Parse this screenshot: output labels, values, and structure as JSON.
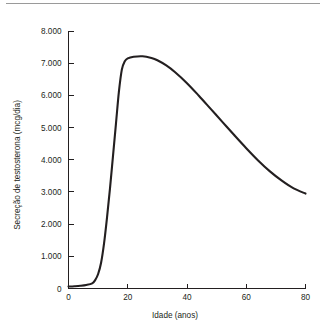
{
  "figure": {
    "separator_name": "top-rule"
  },
  "chart_data": {
    "type": "line",
    "title": "",
    "xlabel": "Idade (anos)",
    "ylabel": "Secreção de testosterona (mcg/dia)",
    "xlim": [
      0,
      80
    ],
    "ylim": [
      0,
      8000
    ],
    "grid": false,
    "legend": "none",
    "xticks": [
      0,
      20,
      40,
      60,
      80
    ],
    "xtick_labels": [
      "0",
      "20",
      "40",
      "60",
      "80"
    ],
    "yticks": [
      0,
      1000,
      2000,
      3000,
      4000,
      5000,
      6000,
      7000,
      8000
    ],
    "ytick_labels": [
      "0",
      "1.000",
      "2.000",
      "3.000",
      "4.000",
      "5.000",
      "6.000",
      "7.000",
      "8.000"
    ],
    "series": [
      {
        "name": "Secreção de testosterona",
        "color": "#231f20",
        "x": [
          0,
          2,
          4,
          6,
          8,
          9,
          10,
          11,
          12,
          13,
          14,
          15,
          16,
          17,
          18,
          19,
          20,
          22,
          25,
          28,
          30,
          33,
          36,
          40,
          44,
          48,
          52,
          56,
          60,
          64,
          68,
          72,
          76,
          80
        ],
        "y": [
          60,
          70,
          85,
          110,
          160,
          260,
          450,
          800,
          1400,
          2200,
          3100,
          4100,
          5100,
          6100,
          6800,
          7060,
          7150,
          7200,
          7215,
          7160,
          7090,
          6930,
          6720,
          6380,
          5990,
          5580,
          5170,
          4760,
          4360,
          3980,
          3640,
          3350,
          3110,
          2950
        ]
      }
    ]
  }
}
